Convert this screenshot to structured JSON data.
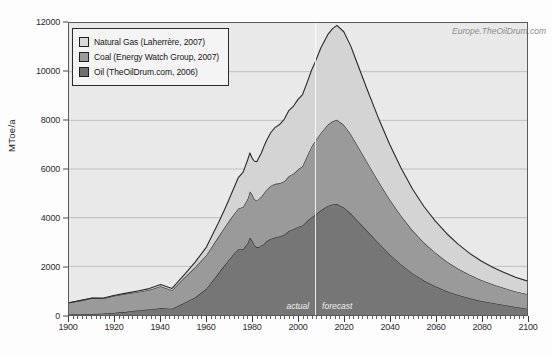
{
  "watermark": "Europe.TheOilDrum.com",
  "axes": {
    "ylabel": "MToe/a",
    "yticks": [
      "0",
      "2000",
      "4000",
      "6000",
      "8000",
      "10000",
      "12000"
    ],
    "xticks": [
      "1900",
      "1920",
      "1940",
      "1960",
      "1980",
      "2000",
      "2020",
      "2040",
      "2060",
      "2080",
      "2100"
    ]
  },
  "legend": {
    "items": [
      {
        "label": "Natural Gas  (Laherrère, 2007)",
        "color": "#d9d9d9"
      },
      {
        "label": "Coal  (Energy Watch Group, 2007)",
        "color": "#9b9b9b"
      },
      {
        "label": "Oil  (TheOilDrum.com, 2006)",
        "color": "#6f6f6f"
      }
    ]
  },
  "annotations": {
    "actual": "actual",
    "forecast": "forecast",
    "divider_year": 2007
  },
  "colors": {
    "plot_background": "#e9e9e9",
    "gas_fill": "#d4d4d4",
    "coal_fill": "#9a9a9a",
    "oil_fill": "#767676",
    "line": "#2a2a2a",
    "gridline": "#b4b4b4",
    "frame": "#5a5a5a"
  },
  "chart_data": {
    "type": "area",
    "title": "",
    "subtitle": "",
    "xlabel": "",
    "ylabel": "MToe/a",
    "xlim": [
      1900,
      2100
    ],
    "ylim": [
      0,
      12000
    ],
    "ytick_step": 2000,
    "xtick_step": 20,
    "grid": true,
    "stacked": true,
    "legend_position": "top-left",
    "units": "MToe/a",
    "annotations": [
      {
        "text": "actual",
        "x": 1990,
        "y": 300
      },
      {
        "text": "forecast",
        "x": 2025,
        "y": 300
      },
      {
        "text": "Europe.TheOilDrum.com",
        "x": 2085,
        "y": 11600
      }
    ],
    "x": [
      1900,
      1905,
      1910,
      1915,
      1920,
      1925,
      1930,
      1935,
      1940,
      1945,
      1950,
      1955,
      1960,
      1965,
      1968,
      1970,
      1972,
      1974,
      1976,
      1978,
      1979,
      1980,
      1981,
      1982,
      1983,
      1984,
      1985,
      1986,
      1988,
      1990,
      1992,
      1994,
      1996,
      1998,
      2000,
      2002,
      2004,
      2006,
      2007,
      2010,
      2013,
      2015,
      2017,
      2020,
      2023,
      2025,
      2030,
      2035,
      2040,
      2045,
      2050,
      2055,
      2060,
      2065,
      2070,
      2075,
      2080,
      2085,
      2090,
      2095,
      2100
    ],
    "series": [
      {
        "name": "Oil (TheOilDrum.com, 2006)",
        "color": "#767676",
        "values": [
          20,
          30,
          45,
          60,
          90,
          130,
          190,
          230,
          280,
          260,
          480,
          720,
          1080,
          1680,
          2050,
          2280,
          2520,
          2700,
          2700,
          2950,
          3180,
          3060,
          2880,
          2780,
          2800,
          2860,
          2900,
          3020,
          3120,
          3190,
          3230,
          3300,
          3450,
          3520,
          3620,
          3680,
          3860,
          4020,
          4080,
          4300,
          4480,
          4540,
          4560,
          4420,
          4180,
          3980,
          3480,
          2980,
          2500,
          2080,
          1720,
          1420,
          1180,
          980,
          820,
          690,
          580,
          490,
          410,
          330,
          260
        ]
      },
      {
        "name": "Coal (Energy Watch Group, 2007)",
        "color": "#9a9a9a",
        "values": [
          480,
          560,
          640,
          620,
          700,
          740,
          760,
          800,
          900,
          760,
          1020,
          1240,
          1380,
          1500,
          1560,
          1600,
          1620,
          1680,
          1740,
          1820,
          1900,
          1900,
          1880,
          1920,
          1980,
          2000,
          2080,
          2100,
          2180,
          2200,
          2180,
          2200,
          2250,
          2280,
          2360,
          2440,
          2680,
          2920,
          3000,
          3180,
          3340,
          3420,
          3460,
          3400,
          3260,
          3140,
          2840,
          2540,
          2260,
          2000,
          1760,
          1560,
          1380,
          1220,
          1080,
          960,
          860,
          770,
          700,
          640,
          600
        ]
      },
      {
        "name": "Natural Gas (Laherrère, 2007)",
        "color": "#d4d4d4",
        "values": [
          5,
          8,
          12,
          15,
          20,
          28,
          40,
          55,
          70,
          70,
          120,
          200,
          330,
          560,
          740,
          900,
          1080,
          1280,
          1420,
          1600,
          1580,
          1480,
          1560,
          1600,
          1700,
          1800,
          1920,
          2000,
          2180,
          2320,
          2420,
          2540,
          2700,
          2780,
          2880,
          2940,
          3020,
          3140,
          3200,
          3500,
          3700,
          3800,
          3880,
          3820,
          3620,
          3440,
          3000,
          2600,
          2260,
          1960,
          1700,
          1480,
          1300,
          1140,
          1000,
          880,
          780,
          700,
          640,
          580,
          540
        ]
      }
    ],
    "totals_note": "Stacked total peaks at approximately 11400 MToe/a around 2017",
    "peak_total": 11400,
    "peak_total_year": 2017
  }
}
